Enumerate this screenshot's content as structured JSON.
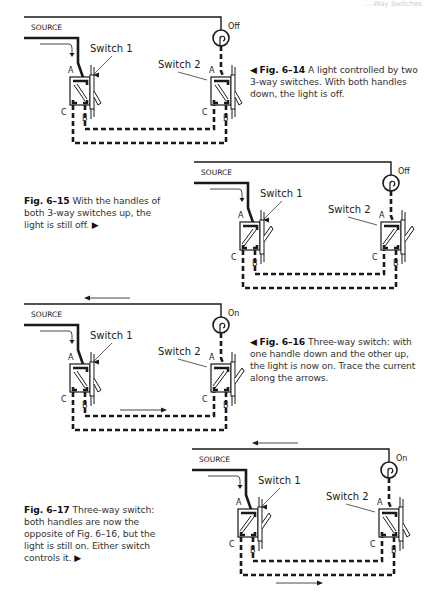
{
  "page": {
    "running_head": "…-Way Switches"
  },
  "labels": {
    "source": "SOURCE",
    "switch1": "Switch 1",
    "switch2": "Switch 2",
    "terminal_a": "A",
    "terminal_b": "B",
    "terminal_c": "C"
  },
  "figures": [
    {
      "id": "fig-6-14",
      "number": "Fig. 6–14",
      "caption": "A light controlled by two 3-way switches. With both handles down, the light is off.",
      "light_state": "Off",
      "switch1_handle": "down",
      "switch2_handle": "down",
      "pointer": "left"
    },
    {
      "id": "fig-6-15",
      "number": "Fig. 6–15",
      "caption": "With the handles of both 3-way switches up, the light is still off.",
      "light_state": "Off",
      "switch1_handle": "up",
      "switch2_handle": "up",
      "pointer": "right"
    },
    {
      "id": "fig-6-16",
      "number": "Fig. 6–16",
      "caption": "Three-way switch: with one handle down and the other up, the light is now on. Trace the current along the arrows.",
      "light_state": "On",
      "switch1_handle": "down",
      "switch2_handle": "up",
      "pointer": "left"
    },
    {
      "id": "fig-6-17",
      "number": "Fig. 6–17",
      "caption": "Three-way switch: both handles are now the opposite of Fig. 6–16, but the light is still on. Either switch controls it.",
      "light_state": "On",
      "switch1_handle": "up",
      "switch2_handle": "down",
      "pointer": "right"
    }
  ]
}
